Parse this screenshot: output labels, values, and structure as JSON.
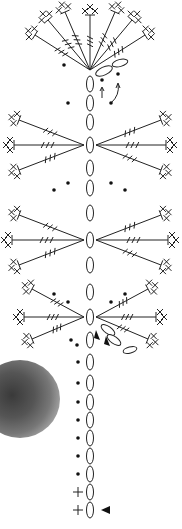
{
  "diagram": {
    "type": "crochet-chart",
    "colors": {
      "ink": "#222222",
      "background": "#ffffff"
    },
    "stem_chain": {
      "x": 90,
      "oval_y": [
        84,
        103,
        122,
        145,
        168,
        188,
        213,
        240,
        265,
        292,
        317,
        340,
        362,
        383,
        402,
        420,
        438,
        456,
        474,
        492,
        510
      ]
    },
    "fans": [
      {
        "cx": 90,
        "cy": 70,
        "side": "top",
        "spokes": [
          [
            -55,
            -35
          ],
          [
            -42,
            -50
          ],
          [
            -25,
            -58
          ],
          [
            0,
            -55
          ],
          [
            25,
            -58
          ],
          [
            42,
            -50
          ],
          [
            55,
            -35
          ]
        ]
      },
      {
        "cx": 84,
        "cy": 145,
        "side": "left",
        "spokes": [
          [
            -65,
            -25
          ],
          [
            -70,
            0
          ],
          [
            -65,
            25
          ]
        ]
      },
      {
        "cx": 96,
        "cy": 145,
        "side": "right",
        "spokes": [
          [
            65,
            -25
          ],
          [
            70,
            0
          ],
          [
            65,
            25
          ]
        ]
      },
      {
        "cx": 84,
        "cy": 240,
        "side": "left",
        "spokes": [
          [
            -65,
            -25
          ],
          [
            -72,
            0
          ],
          [
            -65,
            25
          ]
        ]
      },
      {
        "cx": 96,
        "cy": 240,
        "side": "right",
        "spokes": [
          [
            65,
            -25
          ],
          [
            72,
            0
          ],
          [
            65,
            25
          ]
        ]
      },
      {
        "cx": 84,
        "cy": 317,
        "side": "left",
        "spokes": [
          [
            -52,
            -28
          ],
          [
            -60,
            0
          ],
          [
            -52,
            22
          ]
        ]
      },
      {
        "cx": 96,
        "cy": 317,
        "side": "right",
        "spokes": [
          [
            52,
            -28
          ],
          [
            60,
            0
          ],
          [
            52,
            22
          ]
        ]
      }
    ],
    "dots": [
      [
        64,
        65
      ],
      [
        102,
        80
      ],
      [
        118,
        74
      ],
      [
        68,
        103
      ],
      [
        111,
        103
      ],
      [
        54,
        190
      ],
      [
        68,
        183
      ],
      [
        111,
        183
      ],
      [
        125,
        190
      ],
      [
        54,
        294
      ],
      [
        68,
        302
      ],
      [
        111,
        302
      ],
      [
        125,
        294
      ],
      [
        71,
        340
      ],
      [
        77,
        345
      ],
      [
        78,
        362
      ],
      [
        78,
        383
      ],
      [
        78,
        402
      ],
      [
        78,
        420
      ],
      [
        78,
        438
      ],
      [
        78,
        456
      ],
      [
        78,
        474
      ]
    ],
    "markers": {
      "start_arrow": {
        "x": 101,
        "y": 510,
        "label": "start"
      },
      "arrow_triangles": [
        [
          96,
          336
        ],
        [
          106,
          342
        ]
      ],
      "single_crochet_plus": [
        [
          78,
          492
        ],
        [
          78,
          510
        ]
      ]
    },
    "photo": {
      "description": "grey crocheted round sample (partially visible)"
    }
  }
}
